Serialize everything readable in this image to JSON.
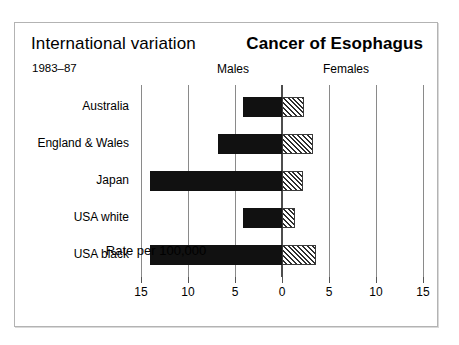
{
  "figure": {
    "title_left": "International variation",
    "title_right": "Cancer of Esophagus",
    "subtitle": "1983–87",
    "group_labels": {
      "males": "Males",
      "females": "Females"
    },
    "axis_caption": "Rate per 100,000"
  },
  "chart_data": {
    "type": "bar",
    "orientation": "horizontal-diverging",
    "title": "Cancer of Esophagus",
    "subtitle": "International variation 1983–87",
    "xlabel": "Rate per 100,000",
    "ylabel": "",
    "grid": true,
    "legend_position": "top",
    "axis_direction": "males plotted leftward, females plotted rightward from 0",
    "xlim": [
      -15,
      15
    ],
    "tick_values": [
      -15,
      -10,
      -5,
      0,
      5,
      10,
      15
    ],
    "tick_labels": [
      "15",
      "10",
      "5",
      "0",
      "5",
      "10",
      "15"
    ],
    "categories": [
      "Australia",
      "England & Wales",
      "Japan",
      "USA white",
      "USA black"
    ],
    "series": [
      {
        "name": "Males",
        "side": "left",
        "style": "solid-black",
        "color": "#111111",
        "values": [
          4.2,
          6.8,
          14.0,
          4.2,
          14.0
        ]
      },
      {
        "name": "Females",
        "side": "right",
        "style": "hatched",
        "color": "#2e2e2e",
        "values": [
          2.3,
          3.3,
          2.2,
          1.4,
          3.6
        ]
      }
    ]
  },
  "colors": {
    "frame_border": "#b3b3b3",
    "gridline": "#8a8a8a",
    "zero_line": "#4d4d4d",
    "male_bar": "#111111",
    "female_hatch": "#2e2e2e",
    "background": "#ffffff"
  }
}
